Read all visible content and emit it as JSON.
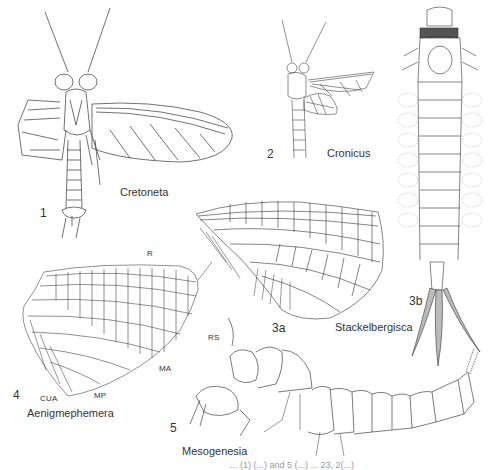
{
  "figure": {
    "panels": [
      {
        "number": "1",
        "taxon": "Cretoneta",
        "description": "adult mayfly, dorsal view with wings spread"
      },
      {
        "number": "2",
        "taxon": "Cronicus",
        "description": "adult mayfly, dorsal view"
      },
      {
        "number": "3a",
        "taxon": "Stackelbergisca",
        "description": "forewing venation"
      },
      {
        "number": "3b",
        "taxon": "Stackelbergisca",
        "description": "nymph, dorsal view"
      },
      {
        "number": "4",
        "taxon": "Aenigmephemera",
        "description": "wing venation"
      },
      {
        "number": "5",
        "taxon": "Mesogenesia",
        "description": "nymph, lateral view"
      }
    ],
    "vein_labels": [
      "R",
      "RS",
      "MA",
      "MP",
      "CUA"
    ],
    "caption_fragment": "... (1) (...) and 5 (...) ... 23, 2(...)"
  }
}
